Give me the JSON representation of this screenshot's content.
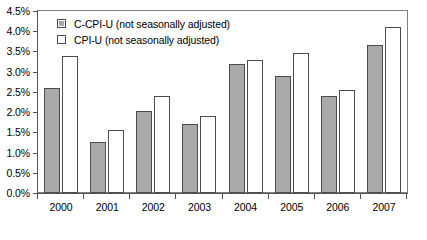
{
  "chart_data": {
    "type": "bar",
    "title": "",
    "subtitle": "",
    "xlabel": "",
    "ylabel": "",
    "categories": [
      "2000",
      "2001",
      "2002",
      "2003",
      "2004",
      "2005",
      "2006",
      "2007"
    ],
    "series": [
      {
        "name": "C-CPI-U (not seasonally adjusted)",
        "color": "#a9a9a9",
        "values": [
          2.6,
          1.27,
          2.03,
          1.7,
          3.2,
          2.9,
          2.4,
          3.65
        ]
      },
      {
        "name": "CPI-U (not seasonally adjusted)",
        "color": "#ffffff",
        "values": [
          3.4,
          1.57,
          2.4,
          1.9,
          3.3,
          3.47,
          2.55,
          4.1
        ]
      }
    ],
    "ylim": [
      0.0,
      4.5
    ],
    "ytick_values": [
      0.0,
      0.5,
      1.0,
      1.5,
      2.0,
      2.5,
      3.0,
      3.5,
      4.0,
      4.5
    ],
    "ytick_labels": [
      "0.0%",
      "0.5%",
      "1.0%",
      "1.5%",
      "2.0%",
      "2.5%",
      "3.0%",
      "3.5%",
      "4.0%",
      "4.5%"
    ],
    "grid": false,
    "legend_position": "top-left",
    "annotations": []
  }
}
